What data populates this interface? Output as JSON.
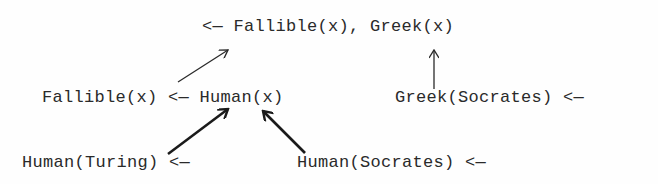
{
  "diagram": {
    "type": "resolution-tree",
    "nodes": [
      {
        "id": "goal",
        "text": "<— Fallible(x), Greek(x)",
        "x": 202,
        "y": 17
      },
      {
        "id": "rule-fallible",
        "text": "Fallible(x) <— Human(x)",
        "x": 42,
        "y": 88
      },
      {
        "id": "fact-greek-socrates",
        "text": "Greek(Socrates) <—",
        "x": 395,
        "y": 88
      },
      {
        "id": "fact-human-turing",
        "text": "Human(Turing) <—",
        "x": 22,
        "y": 153
      },
      {
        "id": "fact-human-socrates",
        "text": "Human(Socrates) <—",
        "x": 297,
        "y": 153
      }
    ],
    "edges": [
      {
        "from": "rule-fallible",
        "to": "goal",
        "style": "thin",
        "x1": 178,
        "y1": 82,
        "x2": 228,
        "y2": 50
      },
      {
        "from": "fact-greek-socrates",
        "to": "goal",
        "style": "thin",
        "x1": 434,
        "y1": 88,
        "x2": 434,
        "y2": 50
      },
      {
        "from": "fact-human-turing",
        "to": "rule-fallible",
        "style": "thick",
        "x1": 168,
        "y1": 154,
        "x2": 228,
        "y2": 109
      },
      {
        "from": "fact-human-socrates",
        "to": "rule-fallible",
        "style": "thick",
        "x1": 305,
        "y1": 153,
        "x2": 263,
        "y2": 111
      }
    ],
    "colors": {
      "ink": "#2a2a2a",
      "background": "#fefefe"
    }
  }
}
